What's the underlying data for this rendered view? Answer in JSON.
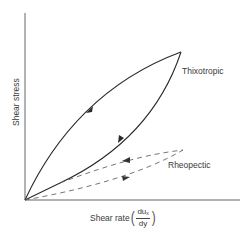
{
  "diagram": {
    "type": "hysteresis-flow-curve",
    "axes": {
      "y_label": "Shear stress",
      "x_label": "Shear rate",
      "x_label_fraction": {
        "numerator": "du",
        "numerator_sub": "x",
        "denominator": "dy"
      }
    },
    "curves": [
      {
        "name": "Thixotropic",
        "style": "solid",
        "color": "#2a2a2a",
        "arrows": [
          "up (loading, upper branch)",
          "down (unloading, lower branch)"
        ]
      },
      {
        "name": "Rheopectic",
        "style": "dashed",
        "color": "#555555",
        "arrows": [
          "right (loading, lower branch)",
          "left (unloading, upper branch)"
        ]
      }
    ],
    "labels": {
      "thixotropic": "Thixotropic",
      "rheopectic": "Rheopectic"
    },
    "colors": {
      "axis": "#555555",
      "solid": "#2a2a2a",
      "dashed": "#666666"
    }
  }
}
